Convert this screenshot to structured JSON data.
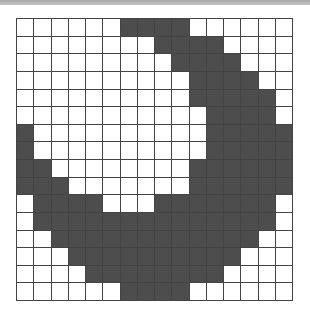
{
  "puzzle": {
    "rows": 16,
    "cols": 16,
    "filled_color": "#4d4d4d",
    "empty_color": "#ffffff",
    "grid_line_color": "#444444",
    "filled_cells_by_row": [
      [
        6,
        7,
        8,
        9
      ],
      [
        8,
        9,
        10,
        11
      ],
      [
        9,
        10,
        11,
        12
      ],
      [
        10,
        11,
        12,
        13
      ],
      [
        10,
        11,
        12,
        13,
        14
      ],
      [
        11,
        12,
        13,
        14
      ],
      [
        0,
        11,
        12,
        13,
        14,
        15
      ],
      [
        0,
        11,
        12,
        13,
        14,
        15
      ],
      [
        0,
        1,
        10,
        11,
        12,
        13,
        14,
        15
      ],
      [
        0,
        1,
        2,
        10,
        11,
        12,
        13,
        14,
        15
      ],
      [
        1,
        2,
        3,
        4,
        8,
        9,
        10,
        11,
        12,
        13,
        14
      ],
      [
        1,
        2,
        3,
        4,
        5,
        6,
        7,
        8,
        9,
        10,
        11,
        12,
        13,
        14
      ],
      [
        2,
        3,
        4,
        5,
        6,
        7,
        8,
        9,
        10,
        11,
        12,
        13
      ],
      [
        3,
        4,
        5,
        6,
        7,
        8,
        9,
        10,
        11,
        12
      ],
      [
        4,
        5,
        6,
        7,
        8,
        9,
        10,
        11
      ],
      [
        6,
        7,
        8,
        9
      ]
    ]
  }
}
